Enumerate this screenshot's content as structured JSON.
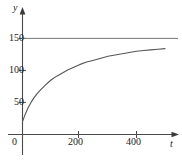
{
  "chart_data": {
    "type": "line",
    "title": "",
    "xlabel": "t",
    "ylabel": "y",
    "xlim": [
      -40,
      520
    ],
    "ylim": [
      -18,
      168
    ],
    "grid": false,
    "legend": "none",
    "x_ticks": [
      0,
      200,
      400
    ],
    "x_tick_labels": [
      "0",
      "200",
      "400"
    ],
    "y_ticks": [
      50,
      100,
      150
    ],
    "y_tick_labels": [
      "50",
      "100",
      "150"
    ],
    "annotations": [
      {
        "name": "asymptote",
        "type": "horizontal-line",
        "y": 150,
        "label": "150"
      }
    ],
    "series": [
      {
        "name": "saturating-growth-curve",
        "color": "#555555",
        "x": [
          0,
          10,
          20,
          30,
          40,
          50,
          60,
          80,
          100,
          120,
          140,
          160,
          180,
          200,
          225,
          250,
          275,
          300,
          325,
          350,
          375,
          400,
          425,
          450,
          475,
          500
        ],
        "y": [
          20,
          32,
          42,
          50,
          57,
          63,
          68,
          77,
          85,
          91,
          96,
          101,
          105,
          109,
          113,
          116,
          119,
          122,
          124,
          126,
          128,
          130,
          131,
          132,
          133,
          134
        ]
      },
      {
        "name": "asymptote-line",
        "color": "#777777",
        "x": [
          0,
          500
        ],
        "y": [
          150,
          150
        ]
      }
    ]
  },
  "figure": {
    "y_axis_name": "y",
    "x_axis_name": "t",
    "y_tick_150": "150",
    "y_tick_100": "100",
    "y_tick_50": "50",
    "x_tick_0": "0",
    "x_tick_200": "200",
    "x_tick_400": "400"
  },
  "colors": {
    "curve": "#555555",
    "asymptote": "#777777",
    "axis": "#4a4a4a",
    "text": "#1c1c1c",
    "background": "#ffffff"
  }
}
